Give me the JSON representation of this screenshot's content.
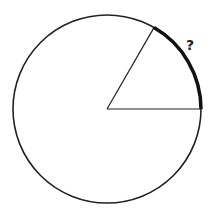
{
  "diagram": {
    "type": "circle-sector",
    "circle": {
      "cx": 107,
      "cy": 109,
      "r": 94,
      "stroke": "#222222"
    },
    "center_angle_deg": 60,
    "radius_lines": [
      {
        "name": "horizontal-radius",
        "x2": 201,
        "y2": 109
      },
      {
        "name": "slanted-radius",
        "x2": 154,
        "y2": 27.6
      }
    ],
    "highlighted_arc": {
      "from_deg": 0,
      "to_deg": 60,
      "stroke_width": 3.5
    },
    "label": {
      "text": "?",
      "x": 186,
      "y": 50
    }
  }
}
